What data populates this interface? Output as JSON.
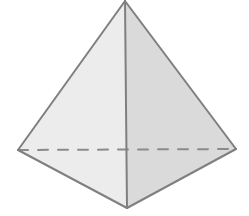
{
  "diagram": {
    "type": "pyramid",
    "colors": {
      "background": "#ffffff",
      "left_face": "#ececec",
      "right_face": "#dadada",
      "stroke": "#7f7f7f",
      "hidden_edge": "#8a8a8a"
    },
    "vertices": {
      "apex": [
        125,
        1
      ],
      "left": [
        18,
        150
      ],
      "right": [
        236,
        149
      ],
      "front": [
        127,
        208
      ]
    },
    "hidden_edge": {
      "from": "left",
      "to": "right",
      "dash": "10 10"
    }
  }
}
